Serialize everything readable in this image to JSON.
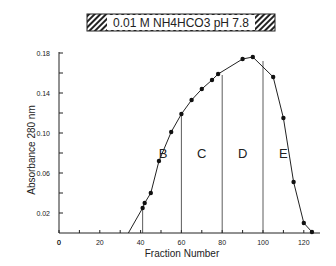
{
  "chart_data": {
    "type": "line",
    "title": "0.01 M  NH4HCO3   pH 7.8",
    "xlabel": "Fraction Number",
    "ylabel": "Absorbance  280 nm",
    "xlim": [
      0,
      125
    ],
    "ylim": [
      0,
      0.18
    ],
    "xticks": [
      "0",
      "20",
      "40",
      "60",
      "80",
      "100",
      "120"
    ],
    "yticks": [
      "0.02",
      "0.06",
      "0.10",
      "0.14",
      "0.18"
    ],
    "x": [
      41,
      42,
      45,
      49,
      55,
      60,
      65,
      70,
      75,
      78,
      90,
      95,
      105,
      110,
      115,
      120,
      124
    ],
    "y": [
      0.025,
      0.03,
      0.04,
      0.072,
      0.101,
      0.119,
      0.133,
      0.144,
      0.153,
      0.159,
      0.174,
      0.176,
      0.156,
      0.115,
      0.051,
      0.01,
      0.001
    ],
    "fraction_boundaries": [
      41,
      60,
      80,
      100
    ],
    "regions": [
      "B",
      "C",
      "D",
      "E"
    ],
    "grid": false
  }
}
